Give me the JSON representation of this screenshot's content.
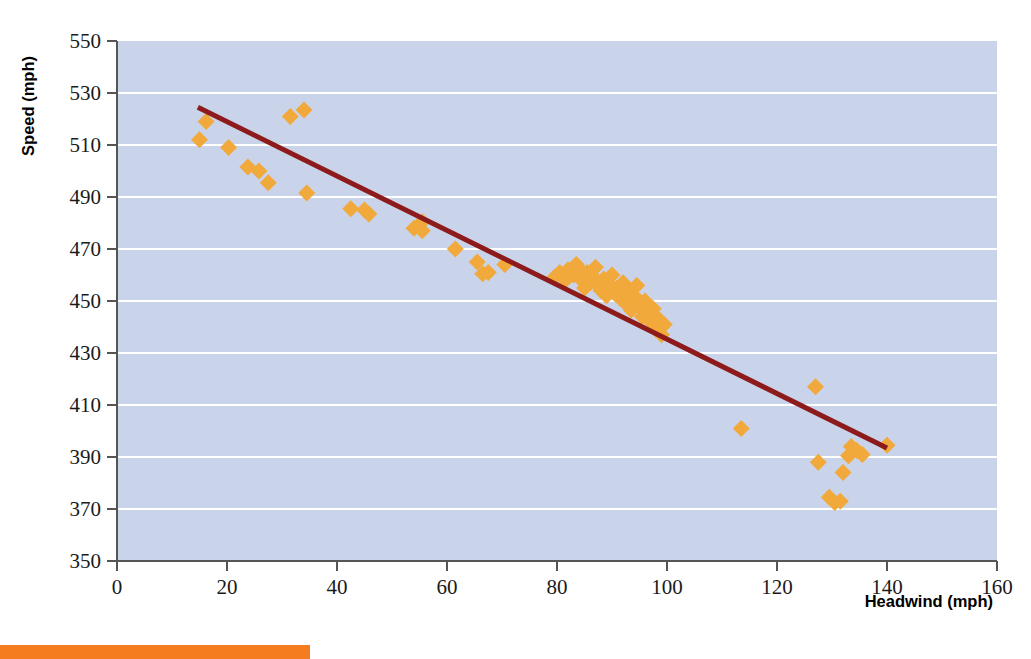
{
  "chart_data": {
    "type": "scatter",
    "title": "",
    "xlabel": "Headwind (mph)",
    "ylabel": "Speed (mph)",
    "xlim": [
      0,
      160
    ],
    "ylim": [
      350,
      550
    ],
    "xticks": [
      0,
      20,
      40,
      60,
      80,
      100,
      120,
      140,
      160
    ],
    "yticks": [
      350,
      370,
      390,
      410,
      430,
      450,
      470,
      490,
      510,
      530,
      550
    ],
    "grid": "horizontal",
    "legend": "none",
    "series": [
      {
        "name": "observations",
        "marker": "diamond",
        "color": "#F2A93B",
        "points": [
          [
            15.0,
            512.0
          ],
          [
            16.2,
            519.0
          ],
          [
            20.3,
            509.0
          ],
          [
            23.8,
            501.5
          ],
          [
            25.8,
            500.0
          ],
          [
            27.5,
            495.5
          ],
          [
            31.5,
            521.0
          ],
          [
            34.0,
            523.5
          ],
          [
            34.5,
            491.5
          ],
          [
            42.5,
            485.5
          ],
          [
            45.0,
            485.0
          ],
          [
            45.8,
            483.5
          ],
          [
            54.0,
            478.0
          ],
          [
            55.5,
            477.0
          ],
          [
            55.5,
            480.5
          ],
          [
            61.5,
            470.0
          ],
          [
            65.5,
            465.0
          ],
          [
            66.5,
            460.5
          ],
          [
            67.5,
            461.0
          ],
          [
            70.5,
            464.0
          ],
          [
            79.5,
            459.0
          ],
          [
            80.5,
            461.0
          ],
          [
            81.5,
            458.0
          ],
          [
            82.0,
            462.0
          ],
          [
            83.0,
            460.0
          ],
          [
            83.5,
            464.0
          ],
          [
            84.0,
            462.5
          ],
          [
            84.5,
            458.0
          ],
          [
            85.0,
            455.0
          ],
          [
            85.5,
            461.0
          ],
          [
            86.0,
            457.0
          ],
          [
            86.5,
            459.5
          ],
          [
            87.0,
            463.0
          ],
          [
            87.5,
            456.0
          ],
          [
            88.0,
            454.0
          ],
          [
            88.5,
            458.5
          ],
          [
            89.0,
            452.0
          ],
          [
            89.5,
            456.5
          ],
          [
            90.0,
            460.0
          ],
          [
            90.5,
            453.0
          ],
          [
            91.0,
            455.0
          ],
          [
            91.5,
            451.0
          ],
          [
            92.0,
            457.0
          ],
          [
            92.5,
            449.0
          ],
          [
            93.0,
            454.0
          ],
          [
            93.5,
            446.5
          ],
          [
            94.0,
            452.0
          ],
          [
            94.5,
            456.0
          ],
          [
            95.0,
            448.0
          ],
          [
            95.5,
            444.0
          ],
          [
            96.0,
            450.0
          ],
          [
            96.5,
            446.0
          ],
          [
            97.0,
            442.0
          ],
          [
            97.5,
            447.0
          ],
          [
            98.0,
            439.0
          ],
          [
            98.5,
            443.0
          ],
          [
            99.0,
            437.0
          ],
          [
            99.5,
            441.0
          ],
          [
            113.5,
            401.0
          ],
          [
            127.0,
            417.0
          ],
          [
            127.5,
            388.0
          ],
          [
            129.5,
            374.5
          ],
          [
            130.5,
            372.5
          ],
          [
            131.5,
            373.0
          ],
          [
            132.0,
            384.0
          ],
          [
            133.0,
            390.5
          ],
          [
            133.5,
            394.0
          ],
          [
            134.5,
            392.5
          ],
          [
            135.5,
            391.0
          ],
          [
            140.0,
            394.5
          ]
        ]
      }
    ],
    "trendline": {
      "name": "least-squares fit",
      "color": "#8E1B1B",
      "x_start": 14.7,
      "y_start": 524.5,
      "x_end": 140.0,
      "y_end": 393.5
    },
    "plot_bgcolor": "#C9D3EA",
    "gridline_color": "#FFFFFF",
    "axis_color": "#555555"
  },
  "footer": {
    "accent_color": "#F57C1F",
    "accent_width_px": 310
  }
}
